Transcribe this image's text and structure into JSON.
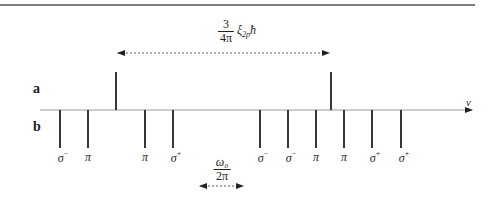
{
  "figure": {
    "row_labels": {
      "a": "a",
      "b": "b"
    },
    "axis": {
      "label": "ν",
      "y": 110,
      "x_start": 40,
      "x_end": 472
    },
    "top_rule": {
      "y": 5,
      "x_start": 0,
      "x_end": 475
    },
    "a_lines": [
      {
        "x": 116,
        "top": 72
      },
      {
        "x": 331,
        "top": 72
      }
    ],
    "b_lines": [
      {
        "x": 60,
        "label": "σ",
        "sup": "−"
      },
      {
        "x": 88,
        "label": "π",
        "sup": ""
      },
      {
        "x": 145,
        "label": "π",
        "sup": ""
      },
      {
        "x": 173,
        "label": "σ",
        "sup": "+"
      },
      {
        "x": 260,
        "label": "σ",
        "sup": "−"
      },
      {
        "x": 288,
        "label": "σ",
        "sup": "−"
      },
      {
        "x": 316,
        "label": "π",
        "sup": ""
      },
      {
        "x": 344,
        "label": "π",
        "sup": ""
      },
      {
        "x": 372,
        "label": "σ",
        "sup": "+"
      },
      {
        "x": 401,
        "label": "σ",
        "sup": "+"
      }
    ],
    "b_line_bottom": 148,
    "spin_orbit_splitting": {
      "numerator": "3",
      "denominator": "4π",
      "tail": "ξ",
      "tail_sub": "2p",
      "tail_end": "ħ",
      "arrow_x_start": 116,
      "arrow_x_end": 331,
      "arrow_y": 53
    },
    "larmor": {
      "numerator": "ω₀",
      "denominator": "2π",
      "arrow_x_start": 198,
      "arrow_x_end": 245,
      "arrow_y": 186
    }
  }
}
